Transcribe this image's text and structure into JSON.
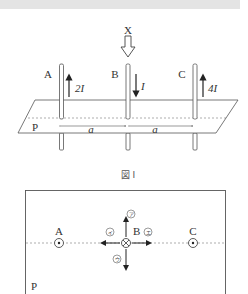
{
  "figure1": {
    "caption": "図 I",
    "view_label": "X",
    "plane_label": "P",
    "wires": [
      {
        "label": "A",
        "current": "2I",
        "direction": "up"
      },
      {
        "label": "B",
        "current": "I",
        "direction": "down"
      },
      {
        "label": "C",
        "current": "4I",
        "direction": "up"
      }
    ],
    "spacing_labels": [
      "a",
      "a"
    ]
  },
  "figure2": {
    "plane_label": "P",
    "points": [
      {
        "label": "A",
        "symbol": "dot-out-of-page"
      },
      {
        "label": "B",
        "symbol": "cross-into-page"
      },
      {
        "label": "C",
        "symbol": "dot-out-of-page"
      }
    ],
    "direction_options": [
      {
        "label": "ア",
        "direction": "up"
      },
      {
        "label": "イ",
        "direction": "left"
      },
      {
        "label": "ウ",
        "direction": "down"
      },
      {
        "label": "エ",
        "direction": "right"
      }
    ]
  },
  "colors": {
    "line": "#333333",
    "dashed": "#777777",
    "header_band": "#e4e4e4"
  }
}
